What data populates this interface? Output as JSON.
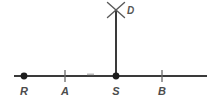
{
  "figure": {
    "type": "geometry-diagram",
    "background_color": "#ffffff",
    "line_color": "#3a3a3a",
    "label_color": "#4c4c4c",
    "faint_mark_color": "#b9b9b9"
  },
  "baseline": {
    "name": "horizontal-line",
    "x_start": 14,
    "x_end": 207,
    "y": 76,
    "stroke_width": 2
  },
  "perpendicular": {
    "name": "vertical-segment",
    "x": 116,
    "y_top": 11,
    "y_bottom": 76,
    "stroke_width": 2
  },
  "cross": {
    "name": "x-mark",
    "center_x": 116,
    "center_y": 10,
    "arm": 9,
    "stroke_width": 1.4
  },
  "faint_tick": {
    "name": "faint-tick",
    "x": 90,
    "y": 74,
    "width": 7,
    "height": 2
  },
  "points": [
    {
      "label": "R",
      "kind": "dot",
      "x": 24,
      "y": 76,
      "label_x": 24,
      "label_y": 86,
      "radius": 3.2
    },
    {
      "label": "A",
      "kind": "tick",
      "x": 65,
      "y": 76,
      "label_x": 65,
      "label_y": 86,
      "tick_half_height": 6
    },
    {
      "label": "S",
      "kind": "dot",
      "x": 116,
      "y": 76,
      "label_x": 116,
      "label_y": 86,
      "radius": 3.2
    },
    {
      "label": "B",
      "kind": "tick",
      "x": 162,
      "y": 76,
      "label_x": 162,
      "label_y": 86,
      "tick_half_height": 6
    }
  ],
  "apex": {
    "label": "D",
    "label_x": 127,
    "label_y": 6
  }
}
